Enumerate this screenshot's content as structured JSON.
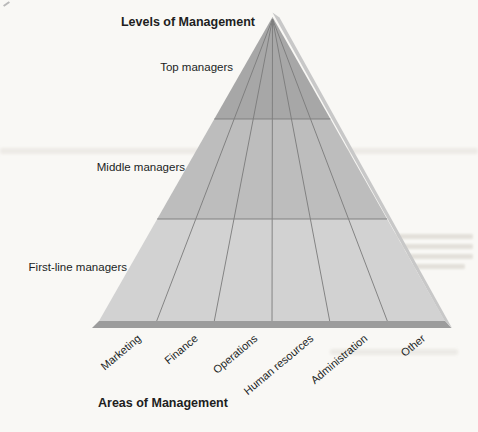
{
  "figure": {
    "title": "Levels of Management",
    "axis_title": "Areas of Management",
    "levels": [
      {
        "label": "Top managers"
      },
      {
        "label": "Middle managers"
      },
      {
        "label": "First-line managers"
      }
    ],
    "areas": [
      {
        "label": "Marketing"
      },
      {
        "label": "Finance"
      },
      {
        "label": "Operations"
      },
      {
        "label": "Human resources"
      },
      {
        "label": "Administration"
      },
      {
        "label": "Other"
      }
    ],
    "colors": {
      "top_band": "#a7a7a7",
      "middle_band": "#bdbdbd",
      "bottom_band": "#d2d2d2",
      "divider_line": "#7b7b7b",
      "edge_highlight": "#c8c8c8",
      "base_shadow": "#9c9c9c",
      "label_text": "#211e1e",
      "paper": "#f9f8f5"
    }
  },
  "bleedthrough": {
    "heading": "INTRODUCTION TO MANAGEMENT"
  }
}
